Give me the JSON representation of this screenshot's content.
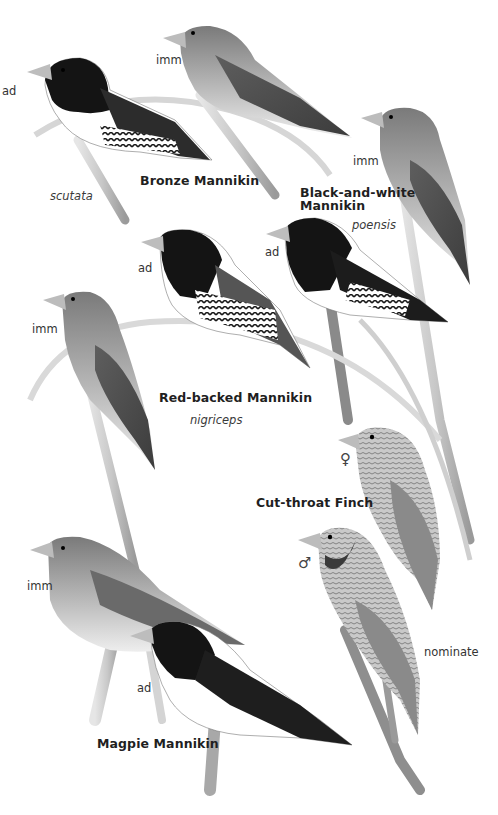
{
  "plate": {
    "style": "greyscale field-guide illustration plate",
    "background": "#ffffff"
  },
  "species": [
    {
      "name": "Bronze Mannikin",
      "subspecies": "scutata",
      "figures": [
        {
          "label": "ad"
        },
        {
          "label": "imm"
        }
      ]
    },
    {
      "name": "Black-and-white Mannikin",
      "name_lines": [
        "Black-and-white",
        "Mannikin"
      ],
      "subspecies": "poensis",
      "figures": [
        {
          "label": "imm"
        },
        {
          "label": "ad"
        }
      ]
    },
    {
      "name": "Red-backed Mannikin",
      "subspecies": "nigriceps",
      "figures": [
        {
          "label": "ad"
        },
        {
          "label": "imm"
        }
      ]
    },
    {
      "name": "Cut-throat Finch",
      "subspecies": "nominate",
      "figures": [
        {
          "label": "♀"
        },
        {
          "label": "♂"
        }
      ]
    },
    {
      "name": "Magpie Mannikin",
      "figures": [
        {
          "label": "imm"
        },
        {
          "label": "ad"
        }
      ]
    }
  ]
}
